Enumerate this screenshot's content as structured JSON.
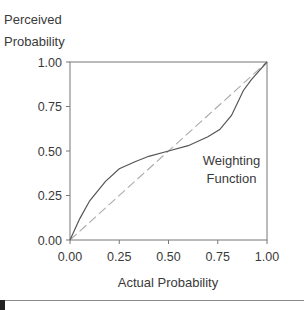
{
  "chart_data": {
    "type": "line",
    "title": "",
    "xlabel": "Actual Probability",
    "ylabel": "Perceived Probability",
    "ylabel_lines": [
      "Perceived",
      "Probability"
    ],
    "xlim": [
      0,
      1
    ],
    "ylim": [
      0,
      1
    ],
    "grid": false,
    "x_ticks": [
      "0.00",
      "0.25",
      "0.50",
      "0.75",
      "1.00"
    ],
    "y_ticks": [
      "0.00",
      "0.25",
      "0.50",
      "0.75",
      "1.00"
    ],
    "series": [
      {
        "name": "Weighting Function",
        "style": "solid",
        "color": "#555555",
        "x": [
          0.0,
          0.05,
          0.1,
          0.18,
          0.25,
          0.33,
          0.4,
          0.5,
          0.6,
          0.7,
          0.76,
          0.82,
          0.88,
          0.92,
          0.96,
          1.0
        ],
        "y": [
          0.0,
          0.12,
          0.22,
          0.33,
          0.4,
          0.44,
          0.47,
          0.5,
          0.53,
          0.58,
          0.62,
          0.7,
          0.84,
          0.9,
          0.95,
          1.0
        ]
      },
      {
        "name": "Identity (reference)",
        "style": "dashed",
        "color": "#aaaaaa",
        "x": [
          0,
          1
        ],
        "y": [
          0,
          1
        ]
      }
    ],
    "annotations": [
      {
        "text_lines": [
          "Weighting",
          "Function"
        ],
        "x": 0.82,
        "y": 0.42
      }
    ],
    "legend": "none"
  }
}
